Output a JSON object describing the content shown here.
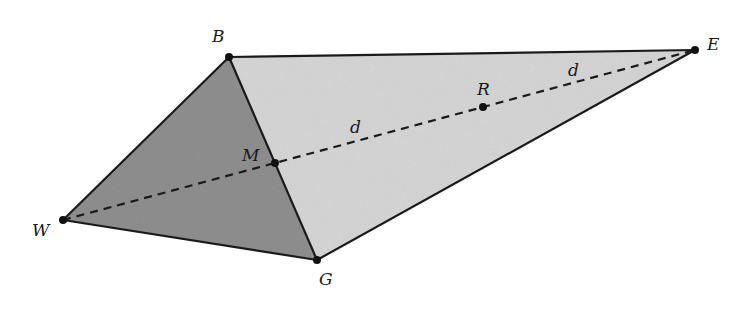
{
  "diagram": {
    "type": "geometric-figure",
    "colors": {
      "dark_face": "#8f8f8f",
      "light_face": "#d6d6d6",
      "edge": "#1a1a1a",
      "background": "#ffffff"
    },
    "points": {
      "B": {
        "label": "B",
        "x": 229,
        "y": 57
      },
      "E": {
        "label": "E",
        "x": 695,
        "y": 50
      },
      "W": {
        "label": "W",
        "x": 63,
        "y": 220
      },
      "G": {
        "label": "G",
        "x": 317,
        "y": 260
      },
      "M": {
        "label": "M",
        "x": 275,
        "y": 163
      },
      "R": {
        "label": "R",
        "x": 483,
        "y": 107
      }
    },
    "labels": {
      "B": "B",
      "E": "E",
      "W": "W",
      "G": "G",
      "M": "M",
      "R": "R",
      "d1": "d",
      "d2": "d"
    },
    "faces": [
      {
        "name": "triangle-BWG",
        "vertices": [
          "B",
          "W",
          "G"
        ],
        "shade": "dark"
      },
      {
        "name": "triangle-BGE",
        "vertices": [
          "B",
          "G",
          "E"
        ],
        "shade": "light"
      }
    ],
    "edges": [
      [
        "B",
        "E"
      ],
      [
        "B",
        "W"
      ],
      [
        "B",
        "G"
      ],
      [
        "W",
        "G"
      ],
      [
        "G",
        "E"
      ]
    ],
    "dashed_segments": [
      [
        "W",
        "E"
      ]
    ],
    "segment_annotations": [
      {
        "segment": [
          "M",
          "R"
        ],
        "label": "d"
      },
      {
        "segment": [
          "R",
          "E"
        ],
        "label": "d"
      }
    ]
  }
}
